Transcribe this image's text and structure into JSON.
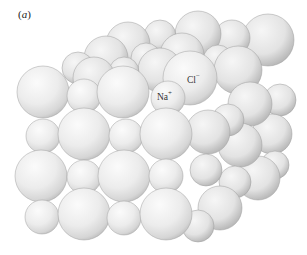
{
  "figure": {
    "panel_label": "a",
    "panel_open": "(",
    "panel_close": ")",
    "background_color": "#ffffff",
    "sphere_color": "#e9e9e9",
    "sphere_shadow_color": "#bdbdbd"
  },
  "labels": {
    "sodium": {
      "symbol": "Na",
      "charge": "+"
    },
    "chloride": {
      "symbol": "Cl",
      "charge": "−"
    }
  },
  "lattice": {
    "front_rows": 4,
    "front_columns": 4,
    "large_ion": "Cl−",
    "small_ion": "Na+"
  }
}
